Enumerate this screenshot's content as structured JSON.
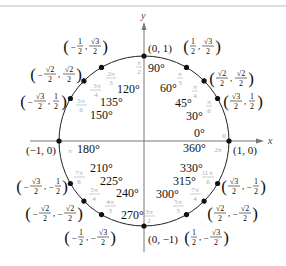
{
  "figure": {
    "axes": {
      "x_label": "x",
      "y_label": "y"
    },
    "colors": {
      "circle": "#222222",
      "axis": "#777777",
      "radian": "#a9a9a9",
      "text": "#111111",
      "rule": "#bbbbbb"
    },
    "points": [
      {
        "angle_deg": 0,
        "deg_label": "0°",
        "deg_label2": "360°",
        "rad_label": "0",
        "rad_label2": "2π",
        "coord": "(1, 0)"
      },
      {
        "angle_deg": 30,
        "deg_label": "30°",
        "rad_label": "π/6",
        "coord": "(√3/2, 1/2)"
      },
      {
        "angle_deg": 45,
        "deg_label": "45°",
        "rad_label": "π/4",
        "coord": "(√2/2, √2/2)"
      },
      {
        "angle_deg": 60,
        "deg_label": "60°",
        "rad_label": "π/3",
        "coord": "(1/2, √3/2)"
      },
      {
        "angle_deg": 90,
        "deg_label": "90°",
        "rad_label": "π/2",
        "coord": "(0, 1)"
      },
      {
        "angle_deg": 120,
        "deg_label": "120°",
        "rad_label": "2π/3",
        "coord": "(−1/2, √3/2)"
      },
      {
        "angle_deg": 135,
        "deg_label": "135°",
        "rad_label": "3π/4",
        "coord": "(−√2/2, √2/2)"
      },
      {
        "angle_deg": 150,
        "deg_label": "150°",
        "rad_label": "5π/6",
        "coord": "(−√3/2, 1/2)"
      },
      {
        "angle_deg": 180,
        "deg_label": "180°",
        "rad_label": "π",
        "coord": "(−1, 0)"
      },
      {
        "angle_deg": 210,
        "deg_label": "210°",
        "rad_label": "7π/6",
        "coord": "(−√3/2, −1/2)"
      },
      {
        "angle_deg": 225,
        "deg_label": "225°",
        "rad_label": "5π/4",
        "coord": "(−√2/2, −√2/2)"
      },
      {
        "angle_deg": 240,
        "deg_label": "240°",
        "rad_label": "4π/3",
        "coord": "(−1/2, −√3/2)"
      },
      {
        "angle_deg": 270,
        "deg_label": "270°",
        "rad_label": "3π/2",
        "coord": "(0, −1)"
      },
      {
        "angle_deg": 300,
        "deg_label": "300°",
        "rad_label": "5π/3",
        "coord": "(1/2, −√3/2)"
      },
      {
        "angle_deg": 315,
        "deg_label": "315°",
        "rad_label": "7π/4",
        "coord": "(√2/2, −√2/2)"
      },
      {
        "angle_deg": 330,
        "deg_label": "330°",
        "rad_label": "11π/6",
        "coord": "(√3/2, −1/2)"
      }
    ],
    "labels": {
      "x": "x",
      "y": "y",
      "d0": "0°",
      "d360": "360°",
      "d30": "30°",
      "d45": "45°",
      "d60": "60°",
      "d90": "90°",
      "d120": "120°",
      "d135": "135°",
      "d150": "150°",
      "d180": "180°",
      "d210": "210°",
      "d225": "225°",
      "d240": "240°",
      "d270": "270°",
      "d300": "300°",
      "d315": "315°",
      "d330": "330°",
      "c10": "(1, 0)",
      "cm10": "(−1, 0)",
      "c01": "(0, 1)",
      "c0m1": "(0, −1)",
      "pi": "π",
      "zero": "0",
      "twopi": "2π",
      "pi_sym": "π",
      "minus": "−",
      "one": "1",
      "two": "2",
      "r3": "√3",
      "r2": "√2",
      "n2": "2",
      "n3": "3",
      "n4": "4",
      "n5": "5",
      "n6": "6",
      "n7": "7",
      "n11": "11"
    }
  }
}
